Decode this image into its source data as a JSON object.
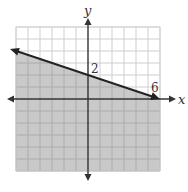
{
  "chart_data": {
    "type": "line",
    "subtype": "linear-inequality-graph",
    "title": "",
    "xlabel": "x",
    "ylabel": "y",
    "xlim": [
      -6,
      6
    ],
    "ylim": [
      -6,
      6
    ],
    "grid": true,
    "grid_step": 1,
    "boundary_line": {
      "equation": "y = -1/3 x + 2",
      "style": "solid",
      "points": [
        [
          -6.5,
          4.17
        ],
        [
          0,
          2
        ],
        [
          6,
          0
        ]
      ],
      "arrows": [
        "left",
        "right"
      ]
    },
    "shaded_region": "below line (y <= -1/3 x + 2)",
    "annotations": [
      {
        "text": "2",
        "x": 0,
        "y": 2,
        "note": "y-intercept"
      },
      {
        "text": "6",
        "x": 6,
        "y": 0,
        "note": "x-intercept"
      }
    ],
    "colors": {
      "shade": "#c9c9c9",
      "grid_unshaded": "#cfcfcf",
      "grid_shaded": "#acacac",
      "line": "#222222"
    }
  },
  "labels": {
    "x_axis": "x",
    "y_axis": "y",
    "y_intercept": "2",
    "x_intercept": "6"
  }
}
